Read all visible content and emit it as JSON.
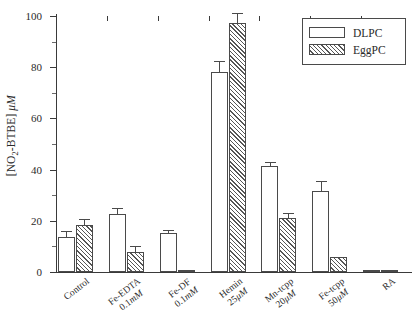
{
  "chart_data": {
    "type": "bar",
    "title": "",
    "xlabel": "",
    "ylabel": "[NO2-BTBE] μM",
    "ylim": [
      0,
      100
    ],
    "ytick_values": [
      0,
      20,
      40,
      60,
      80,
      100
    ],
    "ytick_labels": [
      "0",
      "20",
      "40",
      "60",
      "80",
      "100"
    ],
    "yminor_values": [
      10,
      30,
      50,
      70,
      90
    ],
    "grid": false,
    "legend_position": "upper right",
    "categories": [
      "Control",
      "Fe-EDTA 0.1mM",
      "Fe-DF 0.1mM",
      "Hemin 25μM",
      "Mn-tcpp 20μM",
      "Fe-tcpp 50μM",
      "RA"
    ],
    "category_lines": [
      [
        "Control",
        ""
      ],
      [
        "Fe-EDTA",
        "0.1mM"
      ],
      [
        "Fe-DF",
        "0.1mM"
      ],
      [
        "Hemin",
        "25μM"
      ],
      [
        "Mn-tcpp",
        "20μM"
      ],
      [
        "Fe-tcpp",
        "50μM"
      ],
      [
        "RA",
        ""
      ]
    ],
    "series": [
      {
        "name": "DLPC",
        "fill": "open",
        "values": [
          13.7,
          22.5,
          15.3,
          78.0,
          41.5,
          31.5,
          0.3
        ],
        "errors": [
          1.9,
          2.1,
          0.6,
          4.0,
          1.2,
          3.6,
          0.0
        ]
      },
      {
        "name": "EggPC",
        "fill": "hatched",
        "values": [
          18.3,
          7.8,
          0.3,
          97.3,
          21.0,
          5.8,
          0.3
        ],
        "errors": [
          2.2,
          1.9,
          0.0,
          3.3,
          1.6,
          0.0,
          0.0
        ]
      }
    ]
  },
  "legend": {
    "entries": [
      {
        "label": "DLPC",
        "swatch": "open-bar-swatch"
      },
      {
        "label": "EggPC",
        "swatch": "hatched-bar-swatch"
      }
    ]
  },
  "axis": {
    "y_label_prefix": "[NO",
    "y_label_sub": "2",
    "y_label_mid": "-BTBE] ",
    "y_label_unit": "μM"
  }
}
